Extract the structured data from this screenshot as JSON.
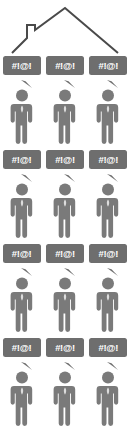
{
  "illustration": {
    "title": "Household members arguing under a house roof",
    "colors": {
      "figure_gray": "#7a7a7a",
      "bubble_gray": "#6e6e6e",
      "bubble_text": "#ffffff",
      "roof_line": "#4a4a4a",
      "background": "#ffffff"
    },
    "roof": {
      "name": "house-roof-outline",
      "has_chimney": true,
      "stroke_width": 2
    },
    "grid": {
      "columns": 3,
      "rows": [
        {
          "type": "bubbles",
          "items": [
            {
              "text": "#!@!"
            },
            {
              "text": "#!@!"
            },
            {
              "text": "#!@!"
            }
          ]
        },
        {
          "type": "people",
          "items": [
            {
              "label": "person"
            },
            {
              "label": "person"
            },
            {
              "label": "person"
            }
          ]
        },
        {
          "type": "bubbles",
          "items": [
            {
              "text": "#!@!"
            },
            {
              "text": "#!@!"
            },
            {
              "text": "#!@!"
            }
          ]
        },
        {
          "type": "people",
          "items": [
            {
              "label": "person"
            },
            {
              "label": "person"
            },
            {
              "label": "person"
            }
          ]
        },
        {
          "type": "bubbles",
          "items": [
            {
              "text": "#!@!"
            },
            {
              "text": "#!@!"
            },
            {
              "text": "#!@!"
            }
          ]
        },
        {
          "type": "people",
          "items": [
            {
              "label": "person"
            },
            {
              "label": "person"
            },
            {
              "label": "person"
            }
          ]
        },
        {
          "type": "bubbles",
          "items": [
            {
              "text": "#!@!"
            },
            {
              "text": "#!@!"
            },
            {
              "text": "#!@!"
            }
          ]
        },
        {
          "type": "people",
          "items": [
            {
              "label": "person"
            },
            {
              "label": "person"
            },
            {
              "label": "person"
            }
          ]
        }
      ]
    }
  }
}
